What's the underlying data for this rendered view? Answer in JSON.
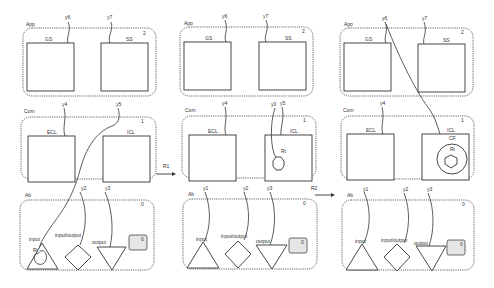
{
  "diagram": {
    "title": "",
    "transitions": [
      {
        "label": "R1",
        "from": "state-1",
        "to": "state-2"
      },
      {
        "label": "R2",
        "from": "state-2",
        "to": "state-3"
      }
    ],
    "states": [
      {
        "id": "state-1",
        "layers": {
          "app": {
            "label": "App",
            "level": "2",
            "components": [
              "GS",
              "SS"
            ],
            "ports": [
              "y6",
              "y7"
            ]
          },
          "com": {
            "label": "Com",
            "level": "1",
            "components": [
              "ECL",
              "ICL"
            ],
            "ports": [
              "y4",
              "y5"
            ]
          },
          "ab": {
            "label": "Ab",
            "level": "0",
            "ports": [
              "y2",
              "y3"
            ],
            "elements": [
              {
                "label": "input",
                "shape": "triangle-up"
              },
              {
                "label": "input/output",
                "shape": "diamond"
              },
              {
                "label": "output",
                "shape": "triangle-down"
              },
              {
                "label": "0",
                "shape": "slot"
              }
            ],
            "inner": {
              "label": "Rt",
              "shape": "blob"
            }
          }
        }
      },
      {
        "id": "state-2",
        "layers": {
          "app": {
            "label": "App",
            "level": "2",
            "components": [
              "GS",
              "SS"
            ],
            "ports": [
              "y6",
              "y7"
            ]
          },
          "com": {
            "label": "Com",
            "level": "1",
            "components": [
              "ECL",
              "ICL"
            ],
            "ports": [
              "y4",
              "y5",
              "y0"
            ],
            "inner": {
              "label": "Rt",
              "shape": "octagon"
            }
          },
          "ab": {
            "label": "Ab",
            "level": "0",
            "ports": [
              "y1",
              "y2",
              "y3"
            ],
            "elements": [
              {
                "label": "input",
                "shape": "triangle-up"
              },
              {
                "label": "input/output",
                "shape": "diamond"
              },
              {
                "label": "output",
                "shape": "triangle-down"
              },
              {
                "label": "0",
                "shape": "slot"
              }
            ]
          }
        }
      },
      {
        "id": "state-3",
        "layers": {
          "app": {
            "label": "App",
            "level": "2",
            "components": [
              "GS",
              "SS"
            ],
            "ports": [
              "y6",
              "y7"
            ]
          },
          "com": {
            "label": "Com",
            "level": "1",
            "components": [
              "ECL",
              "ICL"
            ],
            "ports": [
              "y4"
            ],
            "inner": {
              "label": "CF",
              "sub": "Rt",
              "shape": "circle-hexagon"
            }
          },
          "ab": {
            "label": "Ab",
            "level": "0",
            "ports": [
              "y1",
              "y2",
              "y3"
            ],
            "elements": [
              {
                "label": "input",
                "shape": "triangle-up"
              },
              {
                "label": "input/output",
                "shape": "diamond"
              },
              {
                "label": "output",
                "shape": "triangle-down"
              },
              {
                "label": "0",
                "shape": "slot"
              }
            ]
          }
        }
      }
    ]
  },
  "s1": {
    "app": "App",
    "app_lvl": "2",
    "gs": "GS",
    "ss": "SS",
    "y6": "y6",
    "y7": "y7",
    "com": "Com",
    "com_lvl": "1",
    "ecl": "ECL",
    "icl": "ICL",
    "y4": "y4",
    "y5": "y5",
    "ab": "Ab",
    "ab_lvl": "0",
    "y2": "y2",
    "y3": "y3",
    "input": "input",
    "io": "input/output",
    "output": "output",
    "slot": "0",
    "rt": "Rt"
  },
  "s2": {
    "app": "App",
    "app_lvl": "2",
    "gs": "GS",
    "ss": "SS",
    "y6": "y6",
    "y7": "y7",
    "com": "Com",
    "com_lvl": "1",
    "ecl": "ECL",
    "icl": "ICL",
    "y4": "y4",
    "y5": "y5",
    "y0": "y0",
    "rt": "Rt",
    "ab": "Ab",
    "ab_lvl": "0",
    "y1": "y1",
    "y2": "y2",
    "y3": "y3",
    "input": "input",
    "io": "input/output",
    "output": "output",
    "slot": "0"
  },
  "s3": {
    "app": "App",
    "app_lvl": "2",
    "gs": "GS",
    "ss": "SS",
    "y6": "y6",
    "y7": "y7",
    "com": "Com",
    "com_lvl": "1",
    "ecl": "ECL",
    "icl": "ICL",
    "y4": "y4",
    "cf": "CF",
    "rt": "Rt",
    "ab": "Ab",
    "ab_lvl": "0",
    "y1": "y1",
    "y2": "y2",
    "y3": "y3",
    "input": "input",
    "io": "input/output",
    "output": "output",
    "slot": "0"
  },
  "arrows": {
    "r1": "R1",
    "r2": "R2"
  }
}
